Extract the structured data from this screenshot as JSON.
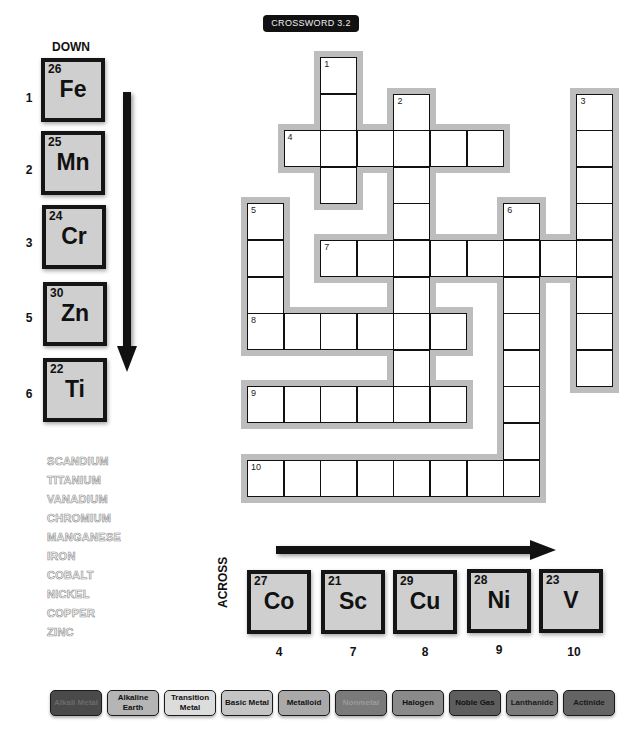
{
  "title": "CROSSWORD 3.2",
  "down": {
    "label": "DOWN",
    "clues": [
      {
        "clue_num": "1",
        "atomic_number": "26",
        "symbol": "Fe"
      },
      {
        "clue_num": "2",
        "atomic_number": "25",
        "symbol": "Mn"
      },
      {
        "clue_num": "3",
        "atomic_number": "24",
        "symbol": "Cr"
      },
      {
        "clue_num": "5",
        "atomic_number": "30",
        "symbol": "Zn"
      },
      {
        "clue_num": "6",
        "atomic_number": "22",
        "symbol": "Ti"
      }
    ]
  },
  "across": {
    "label": "ACROSS",
    "clues": [
      {
        "clue_num": "4",
        "atomic_number": "27",
        "symbol": "Co"
      },
      {
        "clue_num": "7",
        "atomic_number": "21",
        "symbol": "Sc"
      },
      {
        "clue_num": "8",
        "atomic_number": "29",
        "symbol": "Cu"
      },
      {
        "clue_num": "9",
        "atomic_number": "28",
        "symbol": "Ni"
      },
      {
        "clue_num": "10",
        "atomic_number": "23",
        "symbol": "V"
      }
    ]
  },
  "word_bank": [
    "SCANDIUM",
    "TITANIUM",
    "VANADIUM",
    "CHROMIUM",
    "MANGANESE",
    "IRON",
    "COBALT",
    "NICKEL",
    "COPPER",
    "ZINC"
  ],
  "grid": {
    "cell_size": 36.6,
    "origin_x": 247,
    "origin_y": 57,
    "entries": [
      {
        "num": "1",
        "dir": "down",
        "col": 2,
        "row": 0,
        "length": 4
      },
      {
        "num": "2",
        "dir": "down",
        "col": 4,
        "row": 1,
        "length": 9
      },
      {
        "num": "3",
        "dir": "down",
        "col": 9,
        "row": 1,
        "length": 8
      },
      {
        "num": "4",
        "dir": "across",
        "col": 1,
        "row": 2,
        "length": 6
      },
      {
        "num": "5",
        "dir": "down",
        "col": 0,
        "row": 4,
        "length": 4
      },
      {
        "num": "6",
        "dir": "down",
        "col": 7,
        "row": 4,
        "length": 8
      },
      {
        "num": "7",
        "dir": "across",
        "col": 2,
        "row": 5,
        "length": 8
      },
      {
        "num": "8",
        "dir": "across",
        "col": 0,
        "row": 7,
        "length": 6
      },
      {
        "num": "9",
        "dir": "across",
        "col": 0,
        "row": 9,
        "length": 6
      },
      {
        "num": "10",
        "dir": "across",
        "col": 0,
        "row": 11,
        "length": 8
      }
    ]
  },
  "legend": [
    {
      "label": "Alkali Metal",
      "bg": "#4a4a4a",
      "fg": "#6a6a6a"
    },
    {
      "label": "Alkaline Earth",
      "bg": "#b5b5b5",
      "fg": "#111111"
    },
    {
      "label": "Transition Metal",
      "bg": "#dcdcdc",
      "fg": "#111111"
    },
    {
      "label": "Basic Metal",
      "bg": "#c4c4c4",
      "fg": "#111111"
    },
    {
      "label": "Metalloid",
      "bg": "#a9a9a9",
      "fg": "#111111"
    },
    {
      "label": "Nonmetal",
      "bg": "#7a7a7a",
      "fg": "#9a9a9a"
    },
    {
      "label": "Halogen",
      "bg": "#8a8a8a",
      "fg": "#111111"
    },
    {
      "label": "Noble Gas",
      "bg": "#5e5e5e",
      "fg": "#111111"
    },
    {
      "label": "Lanthanide",
      "bg": "#7a7a7a",
      "fg": "#1a1a1a"
    },
    {
      "label": "Actinide",
      "bg": "#646464",
      "fg": "#1a1a1a"
    }
  ]
}
